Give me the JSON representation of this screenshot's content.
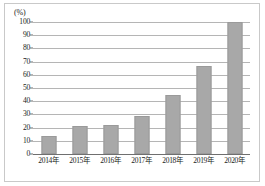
{
  "chart_data": {
    "type": "bar",
    "title": "",
    "subtitle": "",
    "xlabel": "",
    "ylabel": "(%)",
    "unit_label": "(%)",
    "categories": [
      "2014年",
      "2015年",
      "2016年",
      "2017年",
      "2018年",
      "2019年",
      "2020年"
    ],
    "values": [
      14,
      21,
      22,
      29,
      45,
      67,
      100
    ],
    "ylim": [
      0,
      100
    ],
    "ytick_step": 10,
    "yticks": [
      0,
      10,
      20,
      30,
      40,
      50,
      60,
      70,
      80,
      90,
      100
    ],
    "ytick_labels": [
      "0",
      "10",
      "20",
      "30",
      "40",
      "50",
      "60",
      "70",
      "80",
      "90",
      "100"
    ],
    "grid": true,
    "grid_axis": "y",
    "legend": false,
    "legend_position": "none",
    "bar_color": "#a8a8a8",
    "bar_border_color": "#9a9a9a",
    "gridline_color": "#b5b5b5",
    "axis_color": "#6f6f6f",
    "frame_color": "#c9c9c9",
    "text_color": "#1a1a1a"
  }
}
